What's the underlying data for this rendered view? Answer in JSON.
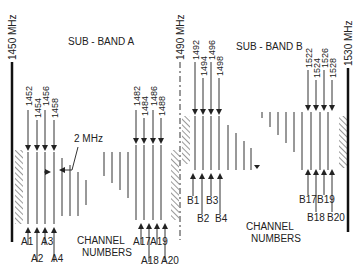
{
  "diagram": {
    "edges": [
      {
        "label": "1450 MHz",
        "x": 12
      },
      {
        "label": "1490 MHz",
        "x": 180
      },
      {
        "label": "1530 MHz",
        "x": 348
      }
    ],
    "sub_bands": [
      {
        "label": "SUB - BAND A",
        "freq_top": [
          "1452",
          "1454",
          "1456",
          "1458"
        ],
        "freq_top_end": [
          "1482",
          "1484",
          "1486",
          "1488"
        ],
        "channels_start": [
          "A1",
          "A2",
          "A3",
          "A4"
        ],
        "channels_end": [
          "A17",
          "A18",
          "A19",
          "A20"
        ],
        "channel_caption_1": "CHANNEL",
        "channel_caption_2": "NUMBERS"
      },
      {
        "label": "SUB - BAND B",
        "freq_top": [
          "1492",
          "1494",
          "1496",
          "1498"
        ],
        "freq_top_end": [
          "1522",
          "1524",
          "1526",
          "1528"
        ],
        "channels_start": [
          "B1",
          "B2",
          "B3",
          "B4"
        ],
        "channels_end": [
          "B17",
          "B18",
          "B19",
          "B20"
        ],
        "channel_caption_1": "CHANNEL",
        "channel_caption_2": "NUMBERS"
      }
    ],
    "spacing_label": "2 MHz",
    "colors": {
      "line": "#222222",
      "background": "#ffffff"
    }
  }
}
